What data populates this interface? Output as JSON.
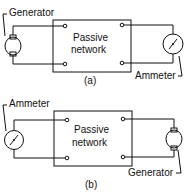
{
  "diagram_a": {
    "box_label_line1": "Passive",
    "box_label_line2": "network",
    "left_device_label": "Generator",
    "right_device_label": "Ammeter",
    "caption": "(a)"
  },
  "diagram_b": {
    "box_label_line1": "Passive",
    "box_label_line2": "network",
    "left_device_label": "Ammeter",
    "right_device_label": "Generator",
    "caption": "(b)"
  },
  "colors": {
    "ink": "#111111",
    "background": "#ffffff"
  }
}
